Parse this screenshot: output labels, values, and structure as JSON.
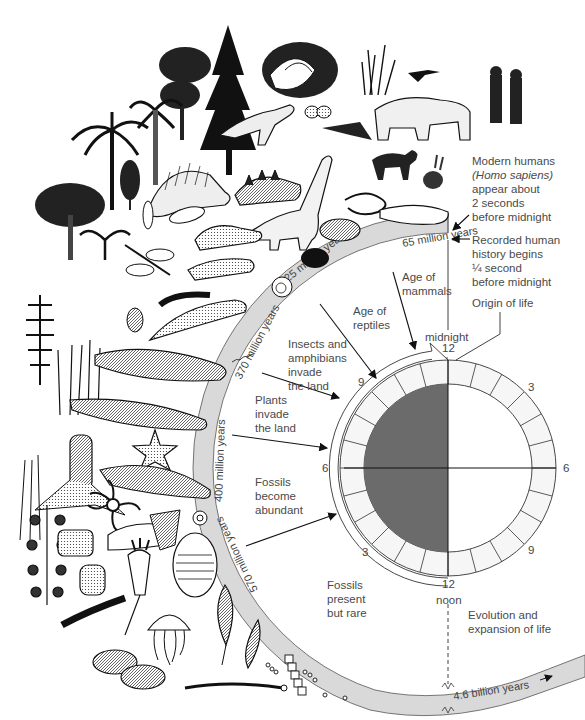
{
  "figure": {
    "type": "geologic-time-clock",
    "clock": {
      "top_number": "12",
      "top_label": "midnight",
      "bottom_number": "12",
      "bottom_label": "noon",
      "left_numbers": {
        "upper": "9",
        "middle": "6",
        "lower": "3"
      },
      "right_numbers": {
        "upper": "3",
        "middle": "6",
        "lower": "9"
      },
      "colors": {
        "dark_half": "#6b6b6b",
        "ring_fill": "#f4f4f4",
        "line": "#333333"
      }
    },
    "timeline_band": {
      "color": "#d9d9d9",
      "labels": [
        "65 million years",
        "225 million years",
        "370 million years",
        "400 million years",
        "570 million years",
        "4.6 billion years"
      ]
    },
    "era_labels": {
      "age_of_mammals": [
        "Age of",
        "mammals"
      ],
      "age_of_reptiles": [
        "Age of",
        "reptiles"
      ],
      "insects_amphibians": [
        "Insects and",
        "amphibians",
        "invade",
        "the land"
      ],
      "plants": [
        "Plants",
        "invade",
        "the land"
      ],
      "fossils_abundant": [
        "Fossils",
        "become",
        "abundant"
      ],
      "fossils_rare": [
        "Fossils",
        "present",
        "but rare"
      ]
    },
    "annotations": {
      "modern_humans": [
        "Modern humans",
        "(Homo sapiens)",
        "appear about",
        "2 seconds",
        "before midnight"
      ],
      "recorded_history": [
        "Recorded human",
        "history begins",
        "¼ second",
        "before midnight"
      ],
      "origin_of_life": "Origin of life",
      "evolution": [
        "Evolution and",
        "expansion of life"
      ]
    }
  }
}
